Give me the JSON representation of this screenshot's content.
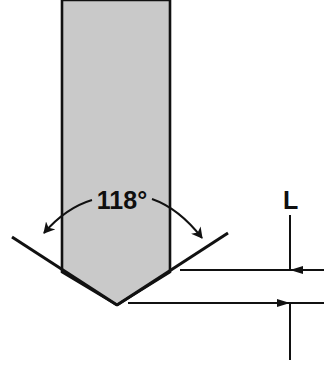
{
  "diagram": {
    "background_color": "#ffffff",
    "line_color": "#111111",
    "body_fill_color": "#c9c9c9",
    "labels": {
      "point_angle": "118°",
      "length": "L"
    },
    "icons": {
      "left_leader": "curved-leader-arrow-icon",
      "right_leader": "curved-leader-arrow-icon",
      "upper_dimension_arrow": "arrow-down-icon",
      "lower_dimension_arrow": "arrow-up-icon"
    },
    "geometry": {
      "shaft_left_x": 62,
      "shaft_right_x": 170,
      "shaft_top_y": 0,
      "tip_apex_x": 117,
      "tip_apex_y": 305,
      "flank_left_end_x": 12,
      "flank_left_end_y": 237,
      "flank_right_end_x": 228,
      "flank_right_end_y": 233,
      "upper_reference_line_y": 270,
      "lower_reference_line_y": 303,
      "dimension_line_x": 290
    }
  }
}
